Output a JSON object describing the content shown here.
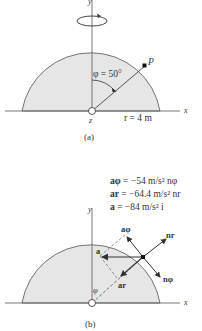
{
  "figure_a": {
    "caption": "(a)",
    "axis_y_label": "y",
    "axis_x_label": "x",
    "axis_z_label": "z",
    "angle_label": "φ = 50°",
    "point_label": "P",
    "radius_label": "r = 4 m",
    "icons": [
      "rotation-arrow-icon"
    ]
  },
  "figure_b": {
    "caption": "(b)",
    "axis_y_label": "y",
    "axis_x_label": "x",
    "angle_label": "φ",
    "equations": [
      {
        "lhs": "aφ",
        "rhs": " = −54 m/s² nφ"
      },
      {
        "lhs": "ar",
        "rhs": " = −64.4 m/s² nr"
      },
      {
        "lhs": "a",
        "rhs": "  = −84 m/s² i"
      }
    ],
    "vector_labels": {
      "a_phi": "aφ",
      "n_r": "nr",
      "a": "a",
      "n_phi": "nφ",
      "a_r": "ar"
    }
  },
  "colors": {
    "fill": "#e6e6e6",
    "line": "#444444",
    "background": "#ffffff"
  }
}
